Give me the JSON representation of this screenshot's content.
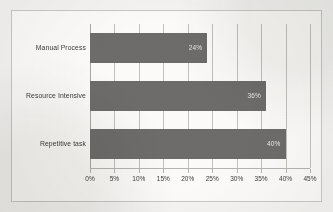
{
  "chart_data": {
    "type": "bar",
    "orientation": "horizontal",
    "title": "",
    "xlabel": "",
    "ylabel": "",
    "categories": [
      "Manual Process",
      "Resource Intensive",
      "Repetitive task"
    ],
    "values": [
      24,
      36,
      40
    ],
    "value_labels": [
      "24%",
      "36%",
      "40%"
    ],
    "xlim": [
      0,
      45
    ],
    "xticks": [
      0,
      5,
      10,
      15,
      20,
      25,
      30,
      35,
      40,
      45
    ],
    "xtick_labels": [
      "0%",
      "5%",
      "10%",
      "15%",
      "20%",
      "25%",
      "30%",
      "35%",
      "40%",
      "45%"
    ],
    "grid": true,
    "legend": false,
    "bar_color": "#6d6c6a",
    "value_label_color": "#e9e8e6",
    "plot_background": "#fbfaf8",
    "border_color": "#c9c7c3"
  }
}
